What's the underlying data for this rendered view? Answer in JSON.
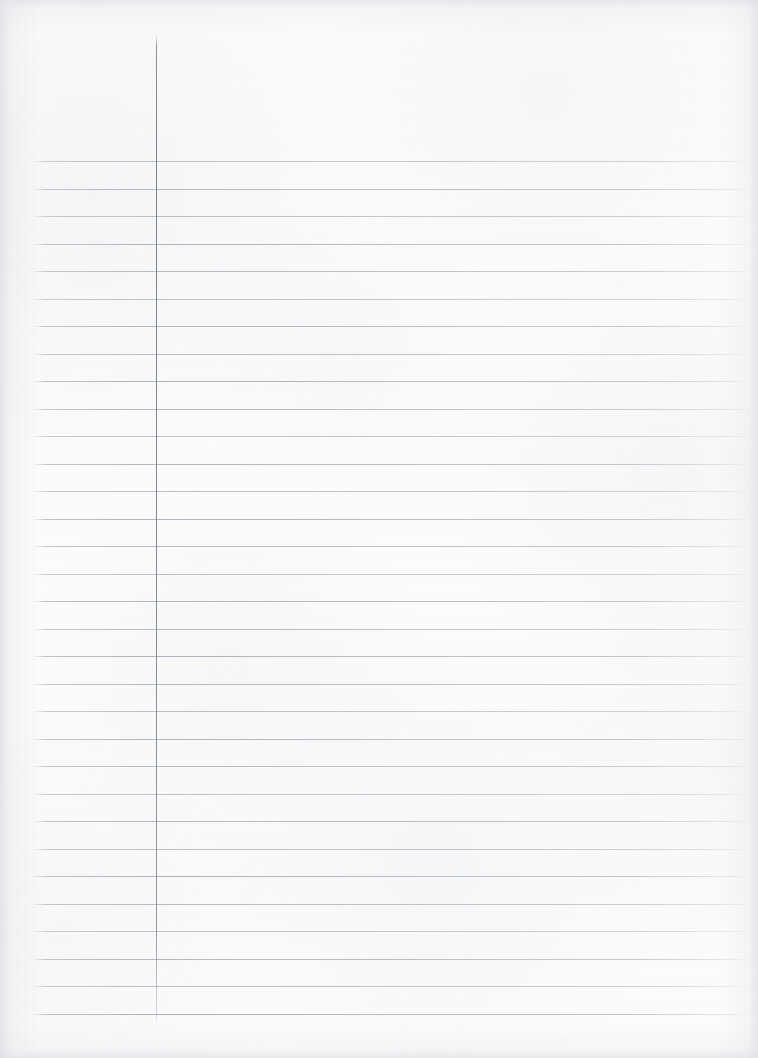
{
  "document": {
    "kind": "ruled-notebook-page",
    "title": "Blank Ruled Notebook Page",
    "written_content": "",
    "page_number": "",
    "header_text": "",
    "footer_text": ""
  },
  "canvas": {
    "width": 758,
    "height": 1058,
    "paper_color": "#fcfcfc",
    "edge_shadow_color": "#dee0e4"
  },
  "rules": {
    "line_color": "#aeb4c0",
    "line_thickness": 1,
    "line_start_x": 32,
    "line_end_x": 751,
    "first_line_y": 161,
    "line_spacing": 27.5,
    "line_count": 32,
    "lines_label": "ruled writing lines"
  },
  "margin": {
    "line_color": "#80869",
    "margin_line_color": "#808693",
    "x": 156,
    "top_y": 35,
    "bottom_y": 1025,
    "thickness": 1,
    "label": "left margin rule"
  }
}
